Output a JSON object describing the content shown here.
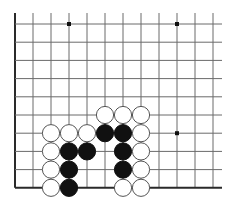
{
  "board": {
    "title": "Go board diagram (lower-left corner section)",
    "origin_x": 15,
    "origin_y": 24,
    "spacing_x": 18,
    "spacing_y": 18.2,
    "cols": 12,
    "rows": 10,
    "top_extension": 11,
    "right_extension": 9,
    "edges": [
      "left",
      "bottom"
    ],
    "colors": {
      "line": "#6a6a6a",
      "edge": "#2a2a2a",
      "black": "#111111",
      "white": "#ffffff",
      "white_outline": "#555555"
    }
  },
  "star_points": [
    {
      "col": 3,
      "row": 0
    },
    {
      "col": 9,
      "row": 0
    },
    {
      "col": 9,
      "row": 6
    }
  ],
  "stones": [
    {
      "color": "white",
      "col": 5,
      "row": 5
    },
    {
      "color": "white",
      "col": 6,
      "row": 5
    },
    {
      "color": "white",
      "col": 7,
      "row": 5
    },
    {
      "color": "white",
      "col": 2,
      "row": 6
    },
    {
      "color": "white",
      "col": 3,
      "row": 6
    },
    {
      "color": "white",
      "col": 4,
      "row": 6
    },
    {
      "color": "black",
      "col": 5,
      "row": 6
    },
    {
      "color": "black",
      "col": 6,
      "row": 6
    },
    {
      "color": "white",
      "col": 7,
      "row": 6
    },
    {
      "color": "white",
      "col": 2,
      "row": 7
    },
    {
      "color": "black",
      "col": 3,
      "row": 7
    },
    {
      "color": "black",
      "col": 4,
      "row": 7
    },
    {
      "color": "black",
      "col": 6,
      "row": 7
    },
    {
      "color": "white",
      "col": 7,
      "row": 7
    },
    {
      "color": "white",
      "col": 2,
      "row": 8
    },
    {
      "color": "black",
      "col": 3,
      "row": 8
    },
    {
      "color": "black",
      "col": 6,
      "row": 8
    },
    {
      "color": "white",
      "col": 7,
      "row": 8
    },
    {
      "color": "white",
      "col": 2,
      "row": 9
    },
    {
      "color": "black",
      "col": 3,
      "row": 9
    },
    {
      "color": "white",
      "col": 6,
      "row": 9
    },
    {
      "color": "white",
      "col": 7,
      "row": 9
    }
  ]
}
